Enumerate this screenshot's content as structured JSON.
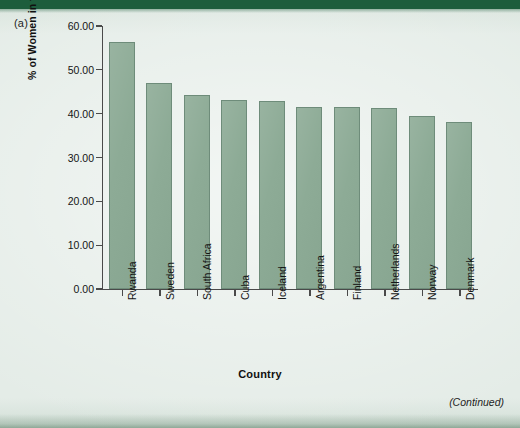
{
  "panel": {
    "label": "(a)"
  },
  "footer": {
    "continued_note": "(Continued)"
  },
  "colors": {
    "page_background": "#e4ece7",
    "top_band": "#1d5d3c",
    "bar_fill": "#8dab96",
    "bar_stroke": "#6e8c7a",
    "axis": "#4a4a4a",
    "text": "#151515"
  },
  "chart_data": {
    "type": "bar",
    "title": "",
    "xlabel": "Country",
    "ylabel": "% of Women in the Parliament",
    "ylim": [
      0,
      60
    ],
    "ytick_labels": [
      "0.00",
      "10.00",
      "20.00",
      "30.00",
      "40.00",
      "50.00",
      "60.00"
    ],
    "ytick_values": [
      0,
      10,
      20,
      30,
      40,
      50,
      60
    ],
    "grid": false,
    "legend": false,
    "categories": [
      "Rwanda",
      "Sweden",
      "South Africa",
      "Cuba",
      "Iceland",
      "Argentina",
      "Finland",
      "Netherlands",
      "Norway",
      "Denmark"
    ],
    "values": [
      56.3,
      47.0,
      44.2,
      43.2,
      42.9,
      41.6,
      41.5,
      41.3,
      39.4,
      38.0
    ]
  }
}
